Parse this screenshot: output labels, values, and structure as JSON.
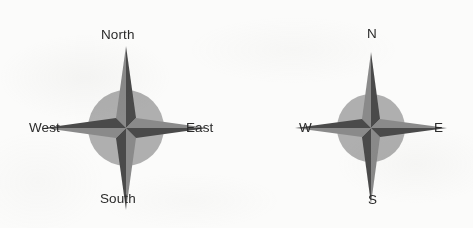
{
  "figure": {
    "kind": "compass-rose-diagram",
    "background_color": "#fbfbfa",
    "label_color": "#2b2b2b",
    "disc_color": "#9a9a9a",
    "ray_light_color": "#7d7d7d",
    "ray_dark_color": "#4a4a4a"
  },
  "roses": [
    {
      "id": "rose-left",
      "name": "compass-rose-full-words",
      "center": {
        "x": 126,
        "y": 128
      },
      "disc_radius": 38,
      "cardinal_ray_length": 82,
      "diagonal_ray_length": 42,
      "labels": {
        "north": "North",
        "east": "East",
        "south": "South",
        "west": "West"
      }
    },
    {
      "id": "rose-right",
      "name": "compass-rose-initials",
      "center": {
        "x": 371,
        "y": 128
      },
      "disc_radius": 34,
      "cardinal_ray_length": 76,
      "diagonal_ray_length": 38,
      "labels": {
        "north": "N",
        "east": "E",
        "south": "S",
        "west": "W"
      }
    }
  ]
}
